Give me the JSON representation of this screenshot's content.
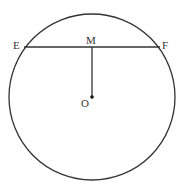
{
  "diagram": {
    "type": "circle-chord",
    "circle": {
      "center": "O",
      "cx": 92,
      "cy": 97,
      "r": 83
    },
    "chord": {
      "from": "E",
      "to": "F",
      "midpoint": "M"
    },
    "segment": {
      "from": "M",
      "to": "O",
      "perpendicular_to": "EF"
    },
    "labels": {
      "E": "E",
      "F": "F",
      "M": "M",
      "O": "O"
    },
    "colors": {
      "stroke": "#333333",
      "background": "#ffffff"
    }
  }
}
